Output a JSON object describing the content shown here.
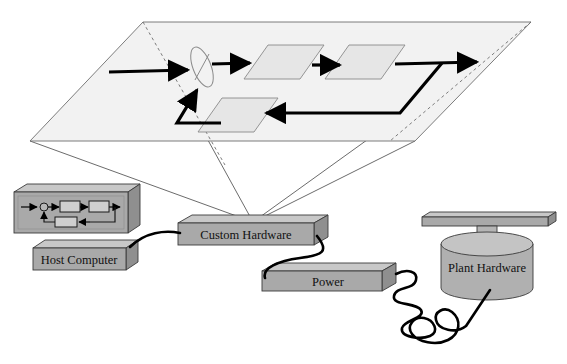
{
  "figure": {
    "type": "system-diagram"
  },
  "colors": {
    "box_top": "#c8c8c8",
    "box_front": "#a9a9a9",
    "box_side": "#8f8f8f",
    "box_outline": "#3a3a3a",
    "plane_fill": "#f2f2f2",
    "plane_outline": "#6e6e6e",
    "block_fill": "#e6e6e6",
    "block_outline": "#8a8a8a",
    "signal": "#000000",
    "cable": "#000000",
    "text": "#111111",
    "projection_line": "#5a5a5a"
  },
  "plane": {
    "name": "control-algorithm-plane",
    "corners": {
      "top": [
        143,
        22
      ],
      "right": [
        531,
        22
      ],
      "bottom": [
        415,
        141
      ],
      "left": [
        30,
        141
      ]
    }
  },
  "block_diagram": {
    "summing_junction": {
      "cx": 201,
      "cy": 68,
      "rx": 9,
      "ry": 20,
      "rotation": -20
    },
    "blocks": [
      {
        "id": "controller",
        "x": 258,
        "y": 45,
        "w": 56,
        "h": 34,
        "skew": 24
      },
      {
        "id": "plant",
        "x": 337,
        "y": 45,
        "w": 56,
        "h": 34,
        "skew": 24
      },
      {
        "id": "sensor",
        "x": 212,
        "y": 98,
        "w": 56,
        "h": 34,
        "skew": 24
      }
    ],
    "signal_paths": [
      {
        "id": "reference-input",
        "from": [
          110,
          71
        ],
        "to": [
          192,
          71
        ]
      },
      {
        "id": "error-to-controller",
        "from": [
          212,
          65
        ],
        "to": [
          254,
          65
        ]
      },
      {
        "id": "controller-to-plant",
        "from": [
          317,
          66
        ],
        "to": [
          340,
          66
        ]
      },
      {
        "id": "plant-to-output",
        "from": [
          398,
          66
        ],
        "to": [
          482,
          64
        ]
      },
      {
        "id": "output-to-feedback",
        "from": [
          440,
          66
        ],
        "to": [
          392,
          112
        ]
      },
      {
        "id": "feedback-to-sensor",
        "from": [
          392,
          112
        ],
        "to": [
          266,
          112
        ]
      },
      {
        "id": "sensor-to-sum",
        "from": [
          222,
          122
        ],
        "to": [
          180,
          122
        ]
      },
      {
        "id": "sum-return",
        "from": [
          180,
          122
        ],
        "to": [
          196,
          89
        ]
      }
    ]
  },
  "projection": {
    "apex": [
      253,
      222
    ],
    "targets": [
      [
        143,
        22
      ],
      [
        531,
        22
      ],
      [
        415,
        141
      ],
      [
        30,
        141
      ]
    ]
  },
  "components": [
    {
      "id": "host-computer",
      "label": "Host Computer",
      "kind": "computer",
      "monitor": {
        "x": 14,
        "y": 184,
        "w": 118,
        "h": 50
      },
      "base": {
        "x": 33,
        "y": 240,
        "w": 105,
        "h": 30
      },
      "screen_diagram": "mini-control-loop"
    },
    {
      "id": "custom-hardware",
      "label": "Custom Hardware",
      "kind": "slab",
      "box": {
        "x": 178,
        "y": 215,
        "w": 150,
        "h": 30
      }
    },
    {
      "id": "power",
      "label": "Power",
      "kind": "slab",
      "box": {
        "x": 262,
        "y": 263,
        "w": 134,
        "h": 28
      }
    },
    {
      "id": "plant-hardware",
      "label": "Plant Hardware",
      "kind": "cylinder-with-bar",
      "cylinder": {
        "cx": 487,
        "cy": 262,
        "rx": 46,
        "ry": 12,
        "h": 44
      },
      "shaft": {
        "x": 478,
        "y": 224,
        "w": 18,
        "h": 22
      },
      "bar": {
        "x": 422,
        "y": 212,
        "w": 128,
        "h": 13
      }
    }
  ],
  "cables": [
    {
      "id": "cable-host-to-custom",
      "from": "host-computer",
      "to": "custom-hardware",
      "style": "smooth-arc"
    },
    {
      "id": "cable-custom-to-power",
      "from": "custom-hardware",
      "to": "power",
      "style": "s-curve"
    },
    {
      "id": "cable-power-to-plant",
      "from": "power",
      "to": "plant-hardware",
      "style": "coiled"
    }
  ]
}
